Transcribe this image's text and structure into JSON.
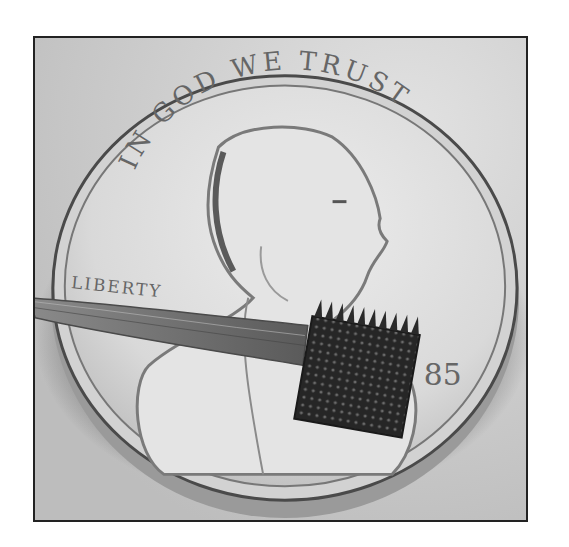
{
  "image": {
    "description": "Grayscale photograph of a microelectrode array on a U.S. penny",
    "coin": {
      "motto": "IN GOD WE TRUST",
      "left_inscription": "LIBERTY",
      "date_fragment": "85"
    },
    "colors": {
      "background": "#cfcfcf",
      "coin_face": "#dedede",
      "coin_rim": "#4a4a4a",
      "shadow": "#555555",
      "array": "#2a2a2a",
      "frame_border": "#222222"
    }
  }
}
